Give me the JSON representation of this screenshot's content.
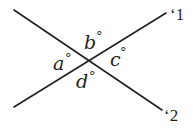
{
  "diagram": {
    "type": "intersecting-lines",
    "colors": {
      "ink": "#231f20",
      "background": "#ffffff"
    },
    "lines": [
      {
        "id": "line-1",
        "label": "‘1",
        "from": [
          14,
          107
        ],
        "to": [
          166,
          13
        ]
      },
      {
        "id": "line-2",
        "label": "‘2",
        "from": [
          14,
          10
        ],
        "to": [
          162,
          110
        ]
      }
    ],
    "intersection": [
      88,
      60
    ],
    "angles": [
      {
        "id": "a",
        "letter": "a",
        "degree_symbol": "°",
        "position": "left"
      },
      {
        "id": "b",
        "letter": "b",
        "degree_symbol": "°",
        "position": "top"
      },
      {
        "id": "c",
        "letter": "c",
        "degree_symbol": "°",
        "position": "right"
      },
      {
        "id": "d",
        "letter": "d",
        "degree_symbol": "°",
        "position": "bottom"
      }
    ]
  }
}
